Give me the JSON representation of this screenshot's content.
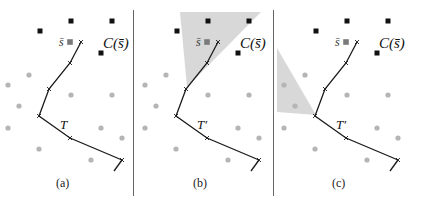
{
  "figure": {
    "panels": [
      {
        "id": "a",
        "caption": "(a)",
        "path_label": "T",
        "point_label": "s̄",
        "cone_label": "C(s̄)",
        "offset_x": 0,
        "shaded_region": null
      },
      {
        "id": "b",
        "caption": "(b)",
        "path_label": "T′",
        "point_label": "s̄",
        "cone_label": "C(s̄)",
        "offset_x": 137,
        "shaded_region": [
          [
            180,
            12
          ],
          [
            261,
            12
          ],
          [
            187,
            87
          ]
        ]
      },
      {
        "id": "c",
        "caption": "(c)",
        "path_label": "T′",
        "point_label": "s̄",
        "cone_label": "C(s̄)",
        "offset_x": 276,
        "shaded_region": [
          [
            277,
            48
          ],
          [
            277,
            112
          ],
          [
            316,
            115
          ]
        ]
      }
    ],
    "colors": {
      "black_square": "#111111",
      "gray_square": "#7a7a7a",
      "gray_dot": "#b5b5b5",
      "path": "#1a1a1a",
      "shade": "#d4d4d4",
      "divider": "#666666"
    }
  }
}
